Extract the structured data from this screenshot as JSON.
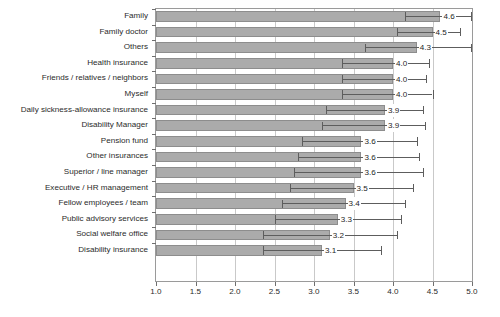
{
  "chart_data": {
    "type": "bar",
    "orientation": "horizontal",
    "title": "",
    "xlabel": "",
    "ylabel": "",
    "xlim": [
      1.0,
      5.0
    ],
    "xticks": [
      "1.0",
      "1.5",
      "2.0",
      "2.5",
      "3.0",
      "3.5",
      "4.0",
      "4.5",
      "5.0"
    ],
    "xtick_values": [
      1.0,
      1.5,
      2.0,
      2.5,
      3.0,
      3.5,
      4.0,
      4.5,
      5.0
    ],
    "grid": true,
    "gridlines": "vertical",
    "legend": "none",
    "error_bars": "horizontal, symmetric about mean",
    "bar_color": "#ababab",
    "bar_edge_color": "#8d8d8d",
    "error_bar_color": "#5d5d5d",
    "grid_color": "#c9c9c9",
    "frame_color": "#9a9a9a",
    "categories": [
      "Family",
      "Family doctor",
      "Others",
      "Health insurance",
      "Friends / relatives / neighbors",
      "Myself",
      "Daily sickness-allowance insurance",
      "Disability Manager",
      "Pension fund",
      "Other insurances",
      "Superior / line manager",
      "Executive / HR management",
      "Fellow employees / team",
      "Public advisory services",
      "Social welfare office",
      "Disability insurance"
    ],
    "values": [
      4.6,
      4.5,
      4.3,
      4.0,
      4.0,
      4.0,
      3.9,
      3.9,
      3.6,
      3.6,
      3.6,
      3.5,
      3.4,
      3.3,
      3.2,
      3.1
    ],
    "value_labels": [
      "4.6",
      "4.5",
      "4.3",
      "4.0",
      "4.0",
      "4.0",
      "3.9",
      "3.9",
      "3.6",
      "3.6",
      "3.6",
      "3.5",
      "3.4",
      "3.3",
      "3.2",
      "3.1"
    ],
    "err_low": [
      4.15,
      4.05,
      3.65,
      3.35,
      3.35,
      3.35,
      3.15,
      3.1,
      2.85,
      2.8,
      2.75,
      2.7,
      2.6,
      2.5,
      2.35,
      2.35
    ],
    "err_high": [
      5.0,
      4.85,
      5.0,
      4.45,
      4.42,
      4.5,
      4.38,
      4.4,
      4.3,
      4.33,
      4.38,
      4.25,
      4.15,
      4.1,
      4.05,
      3.85
    ]
  }
}
